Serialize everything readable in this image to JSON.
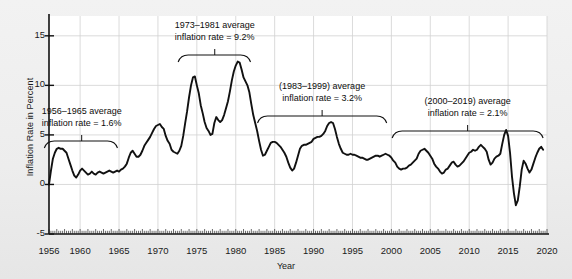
{
  "chart_data": {
    "type": "line",
    "title": "",
    "xlabel": "Year",
    "ylabel": "Inflation Rate in Percent",
    "xlim": [
      1956,
      2020
    ],
    "ylim": [
      -5,
      17
    ],
    "grid": true,
    "legend": "none",
    "line_color": "#111111",
    "plot_background": "#ffffff",
    "figure_background": "#eeeeee",
    "yticks": [
      -5,
      0,
      5,
      10,
      15
    ],
    "ytick_labels": [
      "-5",
      "0",
      "5",
      "10",
      "15"
    ],
    "xticks": [
      1956,
      1960,
      1965,
      1970,
      1975,
      1980,
      1985,
      1990,
      1995,
      2000,
      2005,
      2010,
      2015,
      2020
    ],
    "xtick_labels": [
      "1956",
      "1960",
      "1965",
      "1970",
      "1975",
      "1980",
      "1985",
      "1990",
      "1995",
      "2000",
      "2005",
      "2010",
      "2015",
      "2020"
    ],
    "x": [
      1956.0,
      1956.25,
      1956.5,
      1956.75,
      1957.0,
      1957.25,
      1957.5,
      1957.75,
      1958.0,
      1958.25,
      1958.5,
      1958.75,
      1959.0,
      1959.25,
      1959.5,
      1959.75,
      1960.0,
      1960.25,
      1960.5,
      1960.75,
      1961.0,
      1961.25,
      1961.5,
      1961.75,
      1962.0,
      1962.25,
      1962.5,
      1962.75,
      1963.0,
      1963.25,
      1963.5,
      1963.75,
      1964.0,
      1964.25,
      1964.5,
      1964.75,
      1965.0,
      1965.25,
      1965.5,
      1965.75,
      1966.0,
      1966.25,
      1966.5,
      1966.75,
      1967.0,
      1967.25,
      1967.5,
      1967.75,
      1968.0,
      1968.25,
      1968.5,
      1968.75,
      1969.0,
      1969.25,
      1969.5,
      1969.75,
      1970.0,
      1970.25,
      1970.5,
      1970.75,
      1971.0,
      1971.25,
      1971.5,
      1971.75,
      1972.0,
      1972.25,
      1972.5,
      1972.75,
      1973.0,
      1973.25,
      1973.5,
      1973.75,
      1974.0,
      1974.25,
      1974.5,
      1974.75,
      1975.0,
      1975.25,
      1975.5,
      1975.75,
      1976.0,
      1976.25,
      1976.5,
      1976.75,
      1977.0,
      1977.25,
      1977.5,
      1977.75,
      1978.0,
      1978.25,
      1978.5,
      1978.75,
      1979.0,
      1979.25,
      1979.5,
      1979.75,
      1980.0,
      1980.25,
      1980.5,
      1980.75,
      1981.0,
      1981.25,
      1981.5,
      1981.75,
      1982.0,
      1982.25,
      1982.5,
      1982.75,
      1983.0,
      1983.25,
      1983.5,
      1983.75,
      1984.0,
      1984.25,
      1984.5,
      1984.75,
      1985.0,
      1985.25,
      1985.5,
      1985.75,
      1986.0,
      1986.25,
      1986.5,
      1986.75,
      1987.0,
      1987.25,
      1987.5,
      1987.75,
      1988.0,
      1988.25,
      1988.5,
      1988.75,
      1989.0,
      1989.25,
      1989.5,
      1989.75,
      1990.0,
      1990.25,
      1990.5,
      1990.75,
      1991.0,
      1991.25,
      1991.5,
      1991.75,
      1992.0,
      1992.25,
      1992.5,
      1992.75,
      1993.0,
      1993.25,
      1993.5,
      1993.75,
      1994.0,
      1994.25,
      1994.5,
      1994.75,
      1995.0,
      1995.25,
      1995.5,
      1995.75,
      1996.0,
      1996.25,
      1996.5,
      1996.75,
      1997.0,
      1997.25,
      1997.5,
      1997.75,
      1998.0,
      1998.25,
      1998.5,
      1998.75,
      1999.0,
      1999.25,
      1999.5,
      1999.75,
      2000.0,
      2000.25,
      2000.5,
      2000.75,
      2001.0,
      2001.25,
      2001.5,
      2001.75,
      2002.0,
      2002.25,
      2002.5,
      2002.75,
      2003.0,
      2003.25,
      2003.5,
      2003.75,
      2004.0,
      2004.25,
      2004.5,
      2004.75,
      2005.0,
      2005.25,
      2005.5,
      2005.75,
      2006.0,
      2006.25,
      2006.5,
      2006.75,
      2007.0,
      2007.25,
      2007.5,
      2007.75,
      2008.0,
      2008.25,
      2008.5,
      2008.75,
      2009.0,
      2009.25,
      2009.5,
      2009.75,
      2010.0,
      2010.25,
      2010.5,
      2010.75,
      2011.0,
      2011.25,
      2011.5,
      2011.75,
      2012.0,
      2012.25,
      2012.5,
      2012.75,
      2013.0,
      2013.25,
      2013.5,
      2013.75,
      2014.0,
      2014.25,
      2014.5,
      2014.75,
      2015.0,
      2015.25,
      2015.5,
      2015.75,
      2016.0,
      2016.25,
      2016.5,
      2016.75,
      2017.0,
      2017.25,
      2017.5,
      2017.75,
      2018.0,
      2018.25,
      2018.5,
      2018.75,
      2019.0,
      2019.25,
      2019.5
    ],
    "y": [
      0.0,
      1.4,
      2.6,
      3.2,
      3.6,
      3.7,
      3.6,
      3.6,
      3.4,
      3.2,
      2.6,
      2.0,
      1.4,
      0.9,
      0.7,
      1.0,
      1.4,
      1.6,
      1.4,
      1.2,
      1.0,
      1.1,
      1.3,
      1.1,
      1.0,
      1.2,
      1.3,
      1.2,
      1.1,
      1.2,
      1.3,
      1.4,
      1.3,
      1.2,
      1.3,
      1.4,
      1.3,
      1.5,
      1.6,
      1.8,
      2.1,
      2.7,
      3.2,
      3.4,
      3.1,
      2.8,
      2.8,
      3.0,
      3.4,
      3.9,
      4.2,
      4.5,
      4.8,
      5.2,
      5.6,
      5.9,
      6.0,
      6.1,
      5.8,
      5.6,
      4.9,
      4.4,
      4.1,
      3.5,
      3.3,
      3.2,
      3.1,
      3.4,
      3.9,
      4.9,
      6.2,
      7.4,
      8.8,
      10.0,
      10.8,
      10.9,
      10.0,
      9.2,
      8.0,
      7.2,
      6.3,
      5.7,
      5.4,
      5.0,
      5.1,
      6.2,
      6.8,
      6.5,
      6.3,
      6.5,
      7.0,
      7.7,
      8.4,
      9.4,
      10.5,
      11.4,
      12.0,
      12.4,
      12.3,
      11.6,
      10.8,
      10.4,
      10.0,
      9.3,
      8.1,
      7.0,
      6.2,
      5.4,
      4.4,
      3.5,
      2.9,
      3.0,
      3.4,
      3.8,
      4.2,
      4.3,
      4.3,
      4.2,
      4.0,
      3.8,
      3.5,
      3.2,
      2.8,
      2.2,
      1.7,
      1.4,
      1.6,
      2.2,
      2.9,
      3.6,
      3.9,
      4.0,
      4.0,
      4.1,
      4.2,
      4.3,
      4.6,
      4.7,
      4.8,
      4.8,
      4.9,
      5.1,
      5.4,
      5.9,
      6.2,
      6.3,
      6.2,
      5.6,
      4.8,
      4.1,
      3.6,
      3.2,
      3.1,
      3.0,
      3.0,
      3.1,
      3.0,
      3.0,
      2.9,
      2.8,
      2.7,
      2.7,
      2.6,
      2.5,
      2.5,
      2.6,
      2.7,
      2.8,
      2.9,
      2.9,
      2.8,
      2.9,
      3.0,
      3.1,
      3.0,
      2.9,
      2.7,
      2.4,
      2.2,
      1.8,
      1.6,
      1.5,
      1.6,
      1.6,
      1.7,
      1.9,
      2.0,
      2.2,
      2.4,
      2.6,
      3.1,
      3.4,
      3.5,
      3.6,
      3.4,
      3.2,
      2.9,
      2.6,
      2.1,
      1.8,
      1.6,
      1.3,
      1.1,
      1.2,
      1.5,
      1.6,
      1.9,
      2.2,
      2.3,
      2.0,
      1.8,
      1.9,
      2.1,
      2.3,
      2.6,
      2.9,
      3.2,
      3.3,
      3.5,
      3.4,
      3.5,
      3.8,
      4.0,
      3.8,
      3.6,
      3.3,
      2.5,
      2.0,
      2.2,
      2.6,
      2.8,
      2.9,
      3.1,
      4.1,
      5.0,
      5.5,
      4.9,
      3.2,
      0.8,
      -0.9,
      -2.1,
      -1.6,
      -0.2,
      1.5,
      2.4,
      2.1,
      1.6,
      1.2,
      1.5,
      2.1,
      2.7,
      3.2,
      3.6,
      3.8,
      3.5,
      3.0,
      2.5,
      2.1,
      1.8,
      1.7,
      1.6,
      1.5,
      1.4,
      1.6,
      1.8,
      2.0,
      2.1,
      2.0,
      1.8,
      1.6,
      1.3,
      0.8,
      0.4,
      0.0,
      0.2,
      0.6,
      1.0,
      1.2,
      1.4,
      1.6,
      1.9,
      2.2,
      2.4,
      2.3,
      2.1,
      2.0,
      2.2,
      2.5,
      2.7,
      2.8,
      2.6,
      2.3,
      2.0,
      1.9,
      2.0,
      1.8
    ]
  },
  "annotations": [
    {
      "id": "annot-1956-1965",
      "line1": "1956–1965 average",
      "line2": "inflation rate = 1.6%",
      "bracket_start_year": 1955.4,
      "bracket_end_year": 1964.8,
      "text_center_year": 1960.2,
      "text_top_px": 106,
      "bracket_top_px": 141,
      "average_value": 1.6
    },
    {
      "id": "annot-1973-1981",
      "line1": "1973–1981 average",
      "line2": "inflation rate = 9.2%",
      "bracket_start_year": 1972.6,
      "bracket_end_year": 1981.9,
      "text_center_year": 1977.3,
      "text_top_px": 20,
      "bracket_top_px": 55,
      "average_value": 9.2
    },
    {
      "id": "annot-1983-1999",
      "line1": "(1983–1999) average",
      "line2": "inflation rate = 3.2%",
      "bracket_start_year": 1982.8,
      "bracket_end_year": 1999.4,
      "text_center_year": 1991.1,
      "text_top_px": 81,
      "bracket_top_px": 116,
      "average_value": 3.2
    },
    {
      "id": "annot-2000-2019",
      "line1": "(2000–2019) average",
      "line2": "inflation rate = 2.1%",
      "bracket_start_year": 2000.1,
      "bracket_end_year": 2019.5,
      "text_center_year": 2009.8,
      "text_top_px": 96,
      "bracket_top_px": 131,
      "average_value": 2.1
    }
  ]
}
